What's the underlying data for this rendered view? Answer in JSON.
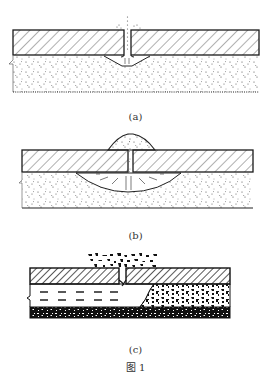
{
  "figure": {
    "title": "图 1",
    "panels": [
      {
        "id": "a",
        "caption": "(a)",
        "description": "Concrete slab with joint; small void under joint in granular base, fines ejected at surface"
      },
      {
        "id": "b",
        "caption": "(b)",
        "description": "Enlarged lens-shaped void beneath joint; pumped fines mounded above joint"
      },
      {
        "id": "c",
        "caption": "(c)",
        "description": "Water-filled void under slab, eroded base material, debris ejected through joint"
      }
    ]
  },
  "colors": {
    "line": "#1a1a1a",
    "hatch": "#3a3a3a",
    "dots": "#444444",
    "background": "#ffffff"
  }
}
